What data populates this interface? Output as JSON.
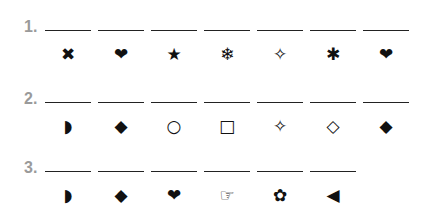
{
  "rows": [
    {
      "number": "1.",
      "symbols": [
        {
          "name": "heavy-x-icon",
          "glyph": "✖"
        },
        {
          "name": "heart-icon",
          "glyph": "❤"
        },
        {
          "name": "star-icon",
          "glyph": "★"
        },
        {
          "name": "snowflake-icon",
          "glyph": "❄"
        },
        {
          "name": "four-point-star-outline-icon",
          "glyph": "✧"
        },
        {
          "name": "asterisk-icon",
          "glyph": "✱"
        },
        {
          "name": "heart-icon",
          "glyph": "❤"
        }
      ]
    },
    {
      "number": "2.",
      "symbols": [
        {
          "name": "half-circle-icon",
          "glyph": "◗"
        },
        {
          "name": "filled-diamond-icon",
          "glyph": "◆"
        },
        {
          "name": "circle-outline-icon",
          "glyph": "○"
        },
        {
          "name": "square-outline-icon",
          "glyph": "□"
        },
        {
          "name": "four-point-star-outline-icon",
          "glyph": "✧"
        },
        {
          "name": "diamond-outline-icon",
          "glyph": "◇"
        },
        {
          "name": "filled-diamond-icon",
          "glyph": "◆"
        }
      ]
    },
    {
      "number": "3.",
      "symbols": [
        {
          "name": "half-circle-icon",
          "glyph": "◗"
        },
        {
          "name": "filled-diamond-icon",
          "glyph": "◆"
        },
        {
          "name": "heart-icon",
          "glyph": "❤"
        },
        {
          "name": "pointing-hand-icon",
          "glyph": "☞"
        },
        {
          "name": "flower-icon",
          "glyph": "✿"
        },
        {
          "name": "left-triangle-icon",
          "glyph": "◀"
        }
      ]
    }
  ],
  "colors": {
    "number": "#9a9a9a",
    "symbol": "#111111",
    "line": "#222222"
  }
}
